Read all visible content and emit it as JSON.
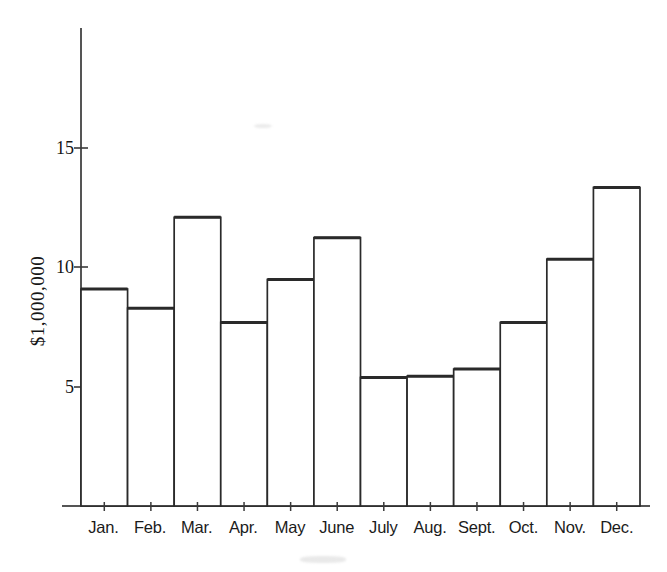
{
  "chart_data": {
    "type": "bar",
    "title": "",
    "subtitle": "",
    "xlabel": "",
    "ylabel": "$1,000,000",
    "categories": [
      "Jan.",
      "Feb.",
      "Mar.",
      "Apr.",
      "May",
      "June",
      "July",
      "Aug.",
      "Sept.",
      "Oct.",
      "Nov.",
      "Dec."
    ],
    "values": [
      9.1,
      8.3,
      12.1,
      7.7,
      9.5,
      11.25,
      5.4,
      5.45,
      5.75,
      7.7,
      10.35,
      13.35
    ],
    "series": [
      {
        "name": "Monthly amount",
        "values": [
          9.1,
          8.3,
          12.1,
          7.7,
          9.5,
          11.25,
          5.4,
          5.45,
          5.75,
          7.7,
          10.35,
          13.35
        ]
      }
    ],
    "ytick_labels": [
      "5",
      "10",
      "15"
    ],
    "ytick_values": [
      5,
      10,
      15
    ],
    "ylim": [
      0,
      17.5
    ],
    "xlim_categories": 12,
    "grid": false,
    "legend": null,
    "legend_position": "none",
    "bar_style": "open-outline",
    "colors": {
      "bar_outline": "#2a2a2a",
      "bar_fill": "#ffffff",
      "axis": "#4a4a4a",
      "text": "#161616",
      "background": "#ffffff"
    },
    "annotations": []
  },
  "axes": {
    "y_axis_label": "$1,000,000",
    "y_ticks": [
      {
        "label": "15",
        "value": 15
      },
      {
        "label": "10",
        "value": 10
      },
      {
        "label": "5",
        "value": 5
      }
    ],
    "x_ticks": [
      {
        "label": "Jan."
      },
      {
        "label": "Feb."
      },
      {
        "label": "Mar."
      },
      {
        "label": "Apr."
      },
      {
        "label": "May"
      },
      {
        "label": "June"
      },
      {
        "label": "July"
      },
      {
        "label": "Aug."
      },
      {
        "label": "Sept."
      },
      {
        "label": "Oct."
      },
      {
        "label": "Nov."
      },
      {
        "label": "Dec."
      }
    ]
  }
}
